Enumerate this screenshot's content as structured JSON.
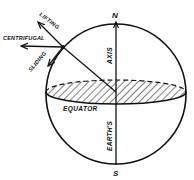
{
  "diagram": {
    "labels": {
      "north": "N",
      "south": "S",
      "axis": "AXIS",
      "earths": "EARTH'S",
      "equator": "EQUATOR",
      "lifting": "LIFTING",
      "centrifugal": "CENTRIFUGAL",
      "sliding": "SLIDING"
    },
    "colors": {
      "ink": "#111111",
      "background": "#ffffff"
    }
  }
}
